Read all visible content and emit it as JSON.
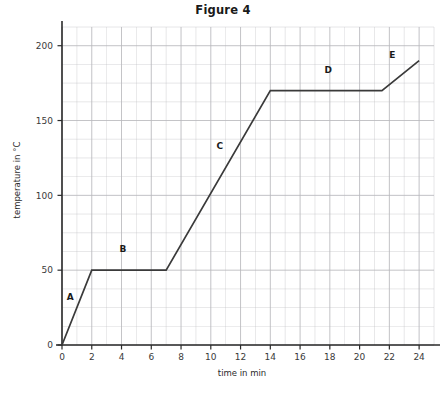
{
  "figure": {
    "title": "Figure 4"
  },
  "axes": {
    "xlabel": "time in min",
    "ylabel": "temperature in °C"
  },
  "chart_data": {
    "type": "line",
    "title": "Figure 4",
    "xlabel": "time in min",
    "ylabel": "temperature in °C",
    "xlim": [
      0,
      25
    ],
    "ylim": [
      0,
      212.5
    ],
    "grid": true,
    "legend_position": "none",
    "x_major_ticks": [
      0,
      2,
      4,
      6,
      8,
      10,
      12,
      14,
      16,
      18,
      20,
      22,
      24
    ],
    "x_major_tick_labels": [
      "0",
      "2",
      "4",
      "6",
      "8",
      "10",
      "12",
      "14",
      "16",
      "18",
      "20",
      "22",
      "24"
    ],
    "x_minor_interval": 1,
    "y_major_ticks": [
      0,
      50,
      100,
      150,
      200
    ],
    "y_major_tick_labels": [
      "0",
      "50",
      "100",
      "150",
      "200"
    ],
    "y_minor_interval": 12.5,
    "line_color": "#3a3a3a",
    "grid_color": "#b9b9bd",
    "series": [
      {
        "name": "heating curve",
        "x": [
          0,
          2,
          7,
          14,
          21.5,
          24
        ],
        "y": [
          0,
          50,
          50,
          170,
          170,
          190
        ]
      }
    ],
    "segments": [
      {
        "label": "A",
        "x0": 0,
        "y0": 0,
        "x1": 2,
        "y1": 50,
        "label_x": 0.55,
        "label_y": 30
      },
      {
        "label": "B",
        "x0": 2,
        "y0": 50,
        "x1": 7,
        "y1": 50,
        "label_x": 4.1,
        "label_y": 62
      },
      {
        "label": "C",
        "x0": 7,
        "y0": 50,
        "x1": 14,
        "y1": 170,
        "label_x": 10.6,
        "label_y": 131
      },
      {
        "label": "D",
        "x0": 14,
        "y0": 170,
        "x1": 21.5,
        "y1": 170,
        "label_x": 17.9,
        "label_y": 182
      },
      {
        "label": "E",
        "x0": 21.5,
        "y0": 170,
        "x1": 24,
        "y1": 190,
        "label_x": 22.2,
        "label_y": 192
      }
    ]
  }
}
